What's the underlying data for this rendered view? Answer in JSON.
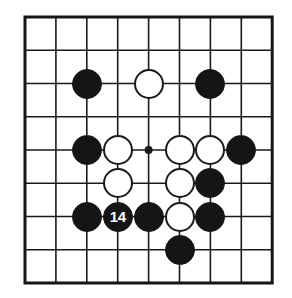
{
  "figure": {
    "name": "go-board-diagram",
    "board_size": 9,
    "background_color": "#ffffff",
    "line_color": "#1a1a1a",
    "border_color": "#151515",
    "black_stone_color": "#151515",
    "white_stone_color": "#ffffff",
    "white_stone_outline_color": "#1a1a1a",
    "label_text_color": "#ffffff"
  },
  "geometry": {
    "origin_x": 25,
    "origin_y": 17,
    "step_x": 30.9,
    "step_y": 33.25,
    "stone_diameter": 30,
    "border_width": 3,
    "line_width": 1.6
  },
  "star_points": [
    {
      "col": 4,
      "row": 4
    }
  ],
  "stones": [
    {
      "col": 2,
      "row": 2,
      "color": "black",
      "label": ""
    },
    {
      "col": 4,
      "row": 2,
      "color": "white",
      "label": ""
    },
    {
      "col": 6,
      "row": 2,
      "color": "black",
      "label": ""
    },
    {
      "col": 2,
      "row": 4,
      "color": "black",
      "label": ""
    },
    {
      "col": 3,
      "row": 4,
      "color": "white",
      "label": ""
    },
    {
      "col": 5,
      "row": 4,
      "color": "white",
      "label": ""
    },
    {
      "col": 6,
      "row": 4,
      "color": "white",
      "label": ""
    },
    {
      "col": 7,
      "row": 4,
      "color": "black",
      "label": ""
    },
    {
      "col": 3,
      "row": 5,
      "color": "white",
      "label": ""
    },
    {
      "col": 5,
      "row": 5,
      "color": "white",
      "label": ""
    },
    {
      "col": 6,
      "row": 5,
      "color": "black",
      "label": ""
    },
    {
      "col": 2,
      "row": 6,
      "color": "black",
      "label": ""
    },
    {
      "col": 3,
      "row": 6,
      "color": "black",
      "label": "14"
    },
    {
      "col": 4,
      "row": 6,
      "color": "black",
      "label": ""
    },
    {
      "col": 5,
      "row": 6,
      "color": "white",
      "label": ""
    },
    {
      "col": 6,
      "row": 6,
      "color": "black",
      "label": ""
    },
    {
      "col": 5,
      "row": 7,
      "color": "black",
      "label": ""
    }
  ]
}
